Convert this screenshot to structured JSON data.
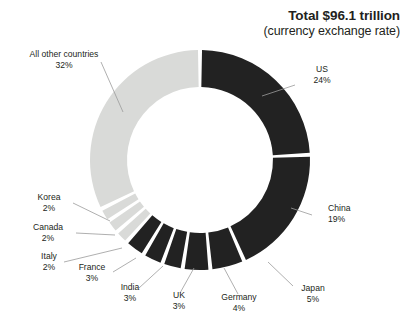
{
  "title": {
    "main": "Total $96.1 trillion",
    "sub": "(currency exchange rate)"
  },
  "colors": {
    "dark": "#222222",
    "light": "#d9dad8",
    "background": "#ffffff",
    "text": "#231f20",
    "leader": "#9a9a9a"
  },
  "chart_data": {
    "type": "pie",
    "title": "Total $96.1 trillion",
    "subtitle": "(currency exchange rate)",
    "units": "percent of world GDP",
    "total_label": "Total $96.1 trillion",
    "donut": true,
    "legend": "none",
    "categories": [
      "US",
      "China",
      "Japan",
      "Germany",
      "UK",
      "India",
      "France",
      "Italy",
      "Canada",
      "Korea",
      "All other countries"
    ],
    "values": [
      24,
      19,
      5,
      4,
      3,
      3,
      3,
      2,
      2,
      2,
      32
    ],
    "slices": [
      {
        "label": "US",
        "pct": 24,
        "pct_text": "24%",
        "color": "dark"
      },
      {
        "label": "China",
        "pct": 19,
        "pct_text": "19%",
        "color": "dark"
      },
      {
        "label": "Japan",
        "pct": 5,
        "pct_text": "5%",
        "color": "dark"
      },
      {
        "label": "Germany",
        "pct": 4,
        "pct_text": "4%",
        "color": "dark"
      },
      {
        "label": "UK",
        "pct": 3,
        "pct_text": "3%",
        "color": "dark"
      },
      {
        "label": "India",
        "pct": 3,
        "pct_text": "3%",
        "color": "dark"
      },
      {
        "label": "France",
        "pct": 3,
        "pct_text": "3%",
        "color": "dark"
      },
      {
        "label": "Italy",
        "pct": 2,
        "pct_text": "2%",
        "color": "light"
      },
      {
        "label": "Canada",
        "pct": 2,
        "pct_text": "2%",
        "color": "light"
      },
      {
        "label": "Korea",
        "pct": 2,
        "pct_text": "2%",
        "color": "light"
      },
      {
        "label": "All other countries",
        "pct": 32,
        "pct_text": "32%",
        "color": "light"
      }
    ]
  },
  "labels": {
    "all_other": {
      "name": "All other countries",
      "pct": "32%"
    },
    "us": {
      "name": "US",
      "pct": "24%"
    },
    "china": {
      "name": "China",
      "pct": "19%"
    },
    "japan": {
      "name": "Japan",
      "pct": "5%"
    },
    "germany": {
      "name": "Germany",
      "pct": "4%"
    },
    "uk": {
      "name": "UK",
      "pct": "3%"
    },
    "india": {
      "name": "India",
      "pct": "3%"
    },
    "france": {
      "name": "France",
      "pct": "3%"
    },
    "italy": {
      "name": "Italy",
      "pct": "2%"
    },
    "canada": {
      "name": "Canada",
      "pct": "2%"
    },
    "korea": {
      "name": "Korea",
      "pct": "2%"
    }
  }
}
